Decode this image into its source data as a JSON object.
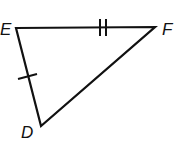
{
  "figure": {
    "type": "triangle",
    "vertices": [
      {
        "name": "E",
        "x": 16,
        "y": 28
      },
      {
        "name": "F",
        "x": 155,
        "y": 27
      },
      {
        "name": "D",
        "x": 41,
        "y": 126
      }
    ],
    "labels": {
      "E": "E",
      "F": "F",
      "D": "D"
    },
    "congruence_marks": [
      {
        "segment": "EF",
        "ticks": 2
      },
      {
        "segment": "ED",
        "ticks": 1
      }
    ],
    "stroke_color": "#111111"
  }
}
